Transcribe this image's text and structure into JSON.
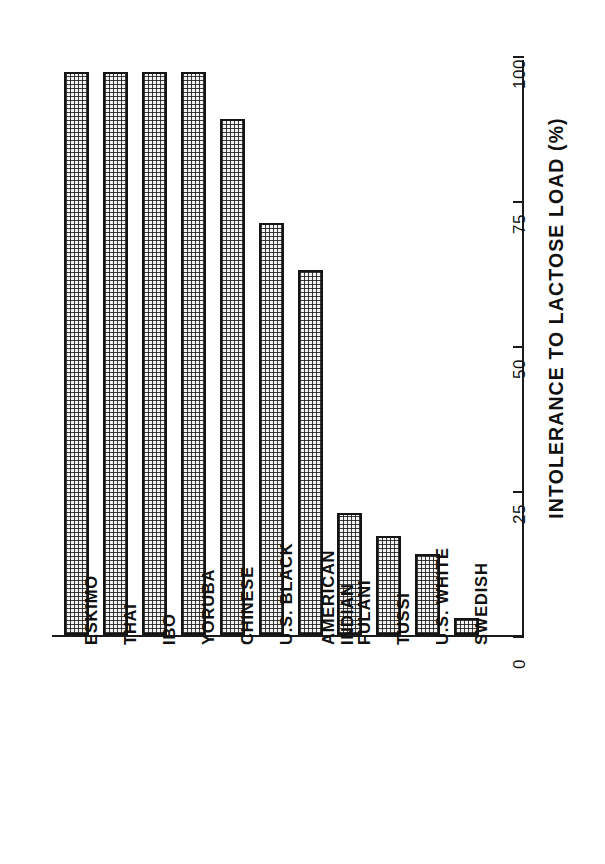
{
  "chart_data": {
    "type": "bar",
    "title": "",
    "subtitle": "",
    "orientation": "vertical-rotated",
    "xlabel": "",
    "ylabel": "INTOLERANCE TO LACTOSE LOAD (%)",
    "ylim": [
      0,
      100
    ],
    "yticks": [
      0,
      25,
      50,
      75,
      100
    ],
    "ytick_labels": [
      "0",
      "25",
      "50",
      "75",
      "100"
    ],
    "grid": false,
    "legend": null,
    "categories": [
      "ESKIMO",
      "THAI",
      "IBO",
      "YORUBA",
      "CHINESE",
      "U.S. BLACK",
      "AMERICAN\nINDIAN",
      "FULANI",
      "TUSSI",
      "U.S. WHITE",
      "SWEDISH"
    ],
    "values": [
      97,
      97,
      97,
      97,
      89,
      71,
      63,
      21,
      17,
      14,
      3
    ],
    "series": [
      {
        "name": "Intolerance to lactose load",
        "values": [
          97,
          97,
          97,
          97,
          89,
          71,
          63,
          21,
          17,
          14,
          3
        ]
      }
    ],
    "bar_fill": "crosshatch-stipple",
    "bar_edge_color": "#141414",
    "bar_face_color": "#f2f2f2",
    "axis_color": "#1a1a1a",
    "background": "#ffffff"
  }
}
